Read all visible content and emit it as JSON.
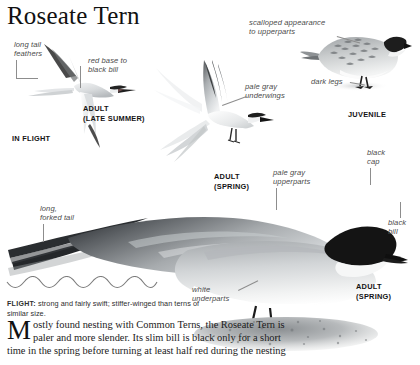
{
  "page": {
    "title": "Roseate Tern",
    "background": "#ffffff",
    "width": 420,
    "height": 365
  },
  "annotations": [
    {
      "id": "long-tail-feathers",
      "text": "long tail\nfeathers"
    },
    {
      "id": "red-base-to-black-bill",
      "text": "red base to\nblack bill"
    },
    {
      "id": "pale-gray-underwings",
      "text": "pale gray\nunderwings"
    },
    {
      "id": "scalloped-appearance",
      "text": "scalloped appearance\nto upperparts"
    },
    {
      "id": "dark-legs",
      "text": "dark legs"
    },
    {
      "id": "pale-gray-upperparts",
      "text": "pale gray\nupperparts"
    },
    {
      "id": "black-cap",
      "text": "black\ncap"
    },
    {
      "id": "black-bill",
      "text": "black\nbill"
    },
    {
      "id": "long-forked-tail",
      "text": "long,\nforked tail"
    },
    {
      "id": "white-underparts",
      "text": "white\nunderparts"
    }
  ],
  "captions": [
    {
      "id": "in-flight",
      "text": "IN FLIGHT"
    },
    {
      "id": "adult-late-summer",
      "text": "ADULT\n(LATE SUMMER)"
    },
    {
      "id": "adult-spring-flight",
      "text": "ADULT\n(SPRING)"
    },
    {
      "id": "juvenile",
      "text": "JUVENILE"
    },
    {
      "id": "adult-spring-perched",
      "text": "ADULT\n(SPRING)"
    }
  ],
  "flight_note": {
    "lead": "FLIGHT:",
    "text": " strong and fairly swift; stiffer-winged than terns of similar size."
  },
  "body": {
    "dropcap": "M",
    "text": "ostly found nesting with Common Terns, the Roseate Tern is paler and more slender. Its slim bill is black only for a short time in the spring before turning at least half red during the nesting"
  },
  "colors": {
    "ink": "#1a1a1a",
    "annotation": "#4b4b4b",
    "leader": "#8d8d8d",
    "plumage_dark": "#2b2b2b",
    "plumage_gray": "#b9bcbe",
    "plumage_light": "#e4e6e7"
  }
}
